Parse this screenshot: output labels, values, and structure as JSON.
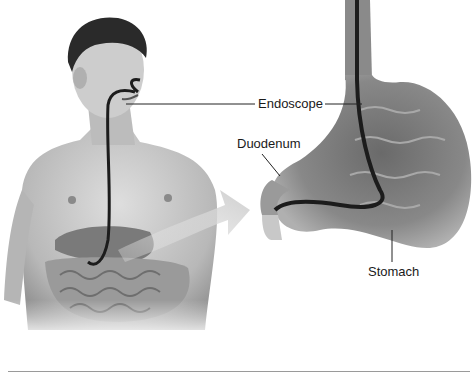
{
  "labels": {
    "endoscope": "Endoscope",
    "duodenum": "Duodenum",
    "stomach": "Stomach"
  },
  "colors": {
    "skin": "#c9c9c9",
    "skin_shadow": "#8e8e8e",
    "hair": "#2a2a2a",
    "endoscope": "#1c1c1c",
    "stomach": "#7a7a7a",
    "stomach_light": "#bdbdbd",
    "arrow": "#d6d6d6",
    "leader_line": "#222222",
    "rule": "#9a9a9a"
  }
}
